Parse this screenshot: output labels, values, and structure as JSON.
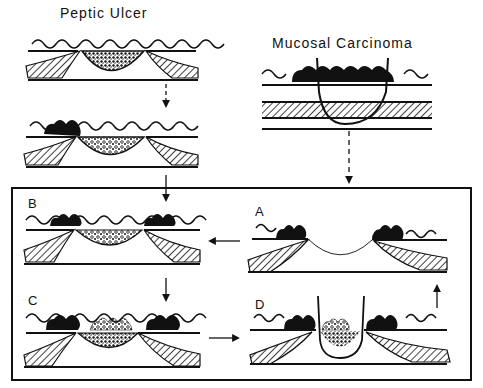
{
  "titles": {
    "peptic_ulcer": "Peptic Ulcer",
    "mucosal_carcinoma": "Mucosal Carcinoma"
  },
  "panels": {
    "A": "A",
    "B": "B",
    "C": "C",
    "D": "D"
  },
  "colors": {
    "ink": "#111111",
    "background": "#ffffff"
  }
}
